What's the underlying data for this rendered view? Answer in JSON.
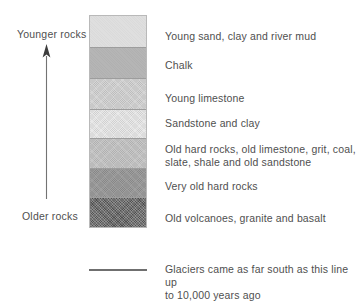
{
  "axis": {
    "top_label": "Younger rocks",
    "bottom_label": "Older rocks",
    "arrow_direction": "up"
  },
  "column": {
    "title": "Rock strata column",
    "layers": [
      {
        "name": "young-sand-clay-river-mud",
        "label": "Young sand, clay and river mud",
        "color": "#dedede",
        "height_px": 32,
        "texture": "smooth",
        "order": 1
      },
      {
        "name": "chalk",
        "label": "Chalk",
        "color": "#b4b4b4",
        "height_px": 31,
        "texture": "smooth",
        "order": 2
      },
      {
        "name": "young-limestone",
        "label": "Young limestone",
        "color": "#d2d2d2",
        "height_px": 31,
        "texture": "dither",
        "order": 3
      },
      {
        "name": "sandstone-and-clay",
        "label": "Sandstone and clay",
        "color": "#e7e7e7",
        "height_px": 29,
        "texture": "dither",
        "order": 4
      },
      {
        "name": "old-hard-rocks",
        "label": "Old hard rocks, old limestone, grit, coal,\nslate, shale and old sandstone",
        "color": "#c3c3c3",
        "height_px": 30,
        "texture": "dither",
        "order": 5
      },
      {
        "name": "very-old-hard-rocks",
        "label": "Very old hard rocks",
        "color": "#969696",
        "height_px": 29,
        "texture": "dither",
        "order": 6
      },
      {
        "name": "old-volcanoes-granite-basalt",
        "label": "Old volcanoes, granite and basalt",
        "color": "#6d6d6d",
        "height_px": 31,
        "texture": "heavy",
        "order": 7
      }
    ]
  },
  "layer_text_positions": [
    {
      "top_px": 30
    },
    {
      "top_px": 59
    },
    {
      "top_px": 92
    },
    {
      "top_px": 117
    },
    {
      "top_px": 143
    },
    {
      "top_px": 180
    },
    {
      "top_px": 212
    }
  ],
  "glacier": {
    "marker_color": "#6f6f6f",
    "text": "Glaciers came as far south as this line up\nto 10,000 years ago"
  },
  "theme": {
    "background": "#ffffff",
    "text_color": "#4f4f4f",
    "column_border": "#b9b9b9",
    "band_divider": "#9d9d9d",
    "arrow_color": "#6b6b6b"
  }
}
